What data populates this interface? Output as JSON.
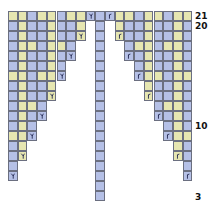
{
  "chart": {
    "colors": {
      "yellow": "#e6e6b1",
      "blue": "#b5c0e6",
      "grid": "#6b6f80",
      "white": "#ffffff"
    },
    "symbols": {
      "L": "ssk-decrease",
      "R": "k2tog-decrease"
    },
    "row_labels": [
      {
        "row": 21,
        "text": "21"
      },
      {
        "row": 20,
        "text": "20"
      },
      {
        "row": 10,
        "text": "10"
      },
      {
        "row": 3,
        "text": "3"
      }
    ],
    "top_row": 21,
    "bottom_row": 3,
    "columns": 19,
    "center_column": 9,
    "rows": [
      {
        "row": 21,
        "left": "YYBYYBYYb",
        "right": "rYYBYYBYY"
      },
      {
        "row": 20,
        "left": "BYBBYBBY",
        "right": "YBBYBBYB"
      },
      {
        "row": 19,
        "left": "BYBBYBBy",
        "right": "yBBYBBYB"
      },
      {
        "row": 18,
        "left": "BYYBYYB",
        "right": "BYYBYYB"
      },
      {
        "row": 17,
        "left": "BYBBYBb",
        "right": "rBYBBYB"
      },
      {
        "row": 16,
        "left": "BYBBYB",
        "right": "BYBBYB"
      },
      {
        "row": 15,
        "left": "YYBYYb",
        "right": "rYYBYY"
      },
      {
        "row": 14,
        "left": "BYBBY",
        "right": "YBBYB"
      },
      {
        "row": 13,
        "left": "BYBBy",
        "right": "yBBYB"
      },
      {
        "row": 12,
        "left": "BYYB",
        "right": "BYYB"
      },
      {
        "row": 11,
        "left": "BYBb",
        "right": "rBYB"
      },
      {
        "row": 10,
        "left": "BYB",
        "right": "BYB"
      },
      {
        "row": 9,
        "left": "YYb",
        "right": "rYY"
      },
      {
        "row": 8,
        "left": "BY",
        "right": "YB"
      },
      {
        "row": 7,
        "left": "By",
        "right": "yB"
      },
      {
        "row": 6,
        "left": "B",
        "right": "B"
      },
      {
        "row": 5,
        "left": "b",
        "right": "r"
      },
      {
        "row": 4,
        "left": "",
        "right": ""
      },
      {
        "row": 3,
        "left": "",
        "right": ""
      }
    ]
  }
}
